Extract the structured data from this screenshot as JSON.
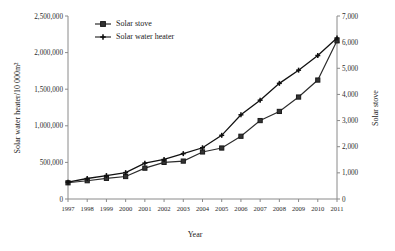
{
  "chart_data": {
    "type": "line",
    "title": "",
    "xlabel": "Year",
    "ylabel": "Solar water heater/10 000m²",
    "ylabel_right": "Solar stove",
    "grid": false,
    "legend_position": "top-left-inside",
    "categories": [
      "1997",
      "1998",
      "1999",
      "2000",
      "2001",
      "2002",
      "2003",
      "2004",
      "2005",
      "2006",
      "2007",
      "2008",
      "2009",
      "2010",
      "2011"
    ],
    "x": [
      1997,
      1998,
      1999,
      2000,
      2001,
      2002,
      2003,
      2004,
      2005,
      2006,
      2007,
      2008,
      2009,
      2010,
      2011
    ],
    "ylim": [
      0,
      2500000
    ],
    "yticks": [
      0,
      500000,
      1000000,
      1500000,
      2000000,
      2500000
    ],
    "ytick_labels": [
      "0",
      "500,000",
      "1,000,000",
      "1,500,000",
      "2,000,000",
      "2,500,000"
    ],
    "ylim_right": [
      0,
      7000
    ],
    "yticks_right": [
      0,
      1000,
      2000,
      3000,
      4000,
      5000,
      6000,
      7000
    ],
    "ytick_labels_right": [
      "0",
      "1,000",
      "2,000",
      "3,000",
      "4,000",
      "5,000",
      "6,000",
      "7,000"
    ],
    "series": [
      {
        "name": "Solar stove",
        "axis": "right",
        "marker": "square",
        "values": [
          620,
          700,
          790,
          860,
          1180,
          1400,
          1450,
          1800,
          1950,
          2400,
          3000,
          3350,
          3900,
          4550,
          6050
        ]
      },
      {
        "name": "Solar water heater",
        "axis": "left",
        "marker": "cross",
        "values": [
          230000,
          280000,
          320000,
          360000,
          490000,
          540000,
          620000,
          700000,
          870000,
          1150000,
          1350000,
          1580000,
          1760000,
          1960000,
          2200000
        ]
      }
    ]
  },
  "legend": {
    "items": [
      {
        "label": "Solar stove",
        "marker": "square"
      },
      {
        "label": "Solar water heater",
        "marker": "cross"
      }
    ]
  },
  "axes": {
    "x_title": "Year",
    "y_left_title": "Solar water heater/10 000m²",
    "y_right_title": "Solar stove"
  }
}
